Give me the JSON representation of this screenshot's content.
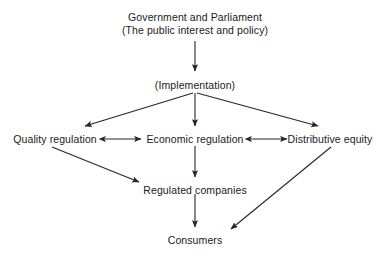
{
  "diagram": {
    "background_color": "#ffffff",
    "line_color": "#262626",
    "text_color": "#1a1a1a",
    "nodes": [
      {
        "id": "government",
        "label": "Government and Parliament\n(The public interest and policy)",
        "line1": "Government and Parliament",
        "line2": "(The public interest and policy)",
        "x": 195,
        "y": 11
      },
      {
        "id": "implementation",
        "label": "(Implementation)",
        "x": 195,
        "y": 79
      },
      {
        "id": "quality-regulation",
        "label": "Quality regulation",
        "x": 55,
        "y": 133
      },
      {
        "id": "economic-regulation",
        "label": "Economic regulation",
        "x": 195,
        "y": 133
      },
      {
        "id": "distributive-equity",
        "label": "Distributive equity",
        "x": 330,
        "y": 133
      },
      {
        "id": "regulated-companies",
        "label": "Regulated companies",
        "x": 195,
        "y": 184
      },
      {
        "id": "consumers",
        "label": "Consumers",
        "x": 195,
        "y": 234
      }
    ],
    "edges": [
      {
        "id": "government-to-implementation",
        "from": "government",
        "to": "implementation",
        "style": "single-arrow",
        "direction": "down"
      },
      {
        "id": "implementation-to-quality",
        "from": "implementation",
        "to": "quality-regulation",
        "style": "single-arrow",
        "direction": "down-left"
      },
      {
        "id": "implementation-to-economic",
        "from": "implementation",
        "to": "economic-regulation",
        "style": "single-arrow",
        "direction": "down"
      },
      {
        "id": "implementation-to-distributive",
        "from": "implementation",
        "to": "distributive-equity",
        "style": "single-arrow",
        "direction": "down-right"
      },
      {
        "id": "quality-economic-bidirectional",
        "from": "quality-regulation",
        "to": "economic-regulation",
        "style": "double-arrow",
        "direction": "horizontal"
      },
      {
        "id": "economic-distributive-bidirectional",
        "from": "economic-regulation",
        "to": "distributive-equity",
        "style": "double-arrow",
        "direction": "horizontal"
      },
      {
        "id": "quality-to-regulated-companies",
        "from": "quality-regulation",
        "to": "regulated-companies",
        "style": "single-arrow",
        "direction": "down-right"
      },
      {
        "id": "economic-to-regulated-companies",
        "from": "economic-regulation",
        "to": "regulated-companies",
        "style": "single-arrow",
        "direction": "down"
      },
      {
        "id": "regulated-companies-to-consumers",
        "from": "regulated-companies",
        "to": "consumers",
        "style": "single-arrow",
        "direction": "down"
      },
      {
        "id": "distributive-to-consumers",
        "from": "distributive-equity",
        "to": "consumers",
        "style": "single-arrow",
        "direction": "down-left"
      }
    ]
  }
}
